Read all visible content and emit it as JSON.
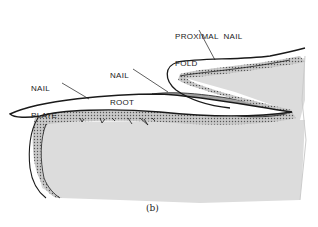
{
  "figure": {
    "caption": "(b)",
    "labels": {
      "proximal_nail_fold_line1": "PROXIMAL  NAIL",
      "proximal_nail_fold_line2": "FOLD",
      "nail_root_line1": "NAIL",
      "nail_root_line2": "ROOT",
      "nail_plate_line1": "NAIL",
      "nail_plate_line2": "PLATE"
    }
  },
  "colors": {
    "outline": "#1a1a1a",
    "tissue_fill": "#dcdcdc",
    "epithelium_fill": "#b8b8b8",
    "background": "#ffffff"
  }
}
